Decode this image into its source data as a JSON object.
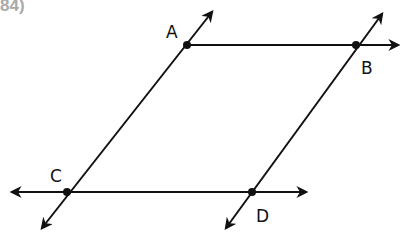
{
  "problem_number": "84)",
  "diagram": {
    "type": "parallel lines figure",
    "points": [
      {
        "label": "A",
        "x": 187,
        "y": 45
      },
      {
        "label": "B",
        "x": 356,
        "y": 45
      },
      {
        "label": "C",
        "x": 67,
        "y": 192
      },
      {
        "label": "D",
        "x": 252,
        "y": 192
      }
    ],
    "lines": [
      {
        "name": "line-AB",
        "from": "A",
        "direction": "right"
      },
      {
        "name": "line-CD",
        "arrows": "both"
      },
      {
        "name": "line-AC",
        "arrows": "both"
      },
      {
        "name": "line-BD",
        "arrows": "both"
      }
    ]
  }
}
